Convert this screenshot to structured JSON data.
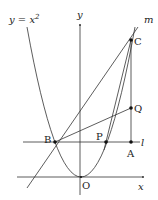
{
  "diagram": {
    "curve_label": "y = x",
    "curve_exp": "2",
    "axis_x_label": "x",
    "axis_y_label": "y",
    "line_m_label": "m",
    "line_l_label": "l",
    "points": {
      "O": "O",
      "A": "A",
      "B": "B",
      "C": "C",
      "P": "P",
      "Q": "Q"
    }
  }
}
